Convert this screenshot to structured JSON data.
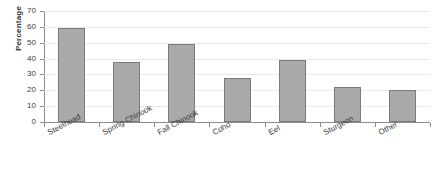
{
  "chart_data": {
    "type": "bar",
    "title": "",
    "xlabel": "",
    "ylabel": "Percentage",
    "ylim": [
      0,
      70
    ],
    "yticks": [
      0,
      10,
      20,
      30,
      40,
      50,
      60,
      70
    ],
    "ytick_labels": [
      "0",
      "10",
      "20",
      "30",
      "40",
      "50",
      "60",
      "70"
    ],
    "grid": true,
    "legend": "none",
    "categories": [
      "Steelhead",
      "Spring Chinook",
      "Fall Chinook",
      "Coho",
      "Eel",
      "Sturgeon",
      "Other"
    ],
    "values": [
      59,
      38,
      49,
      28,
      39,
      22,
      20
    ],
    "series": [
      {
        "name": "Percentage",
        "values": [
          59,
          38,
          49,
          28,
          39,
          22,
          20
        ]
      }
    ],
    "bar_fill_color": "#a9a9a9",
    "bar_border_color": "#7b7b7b",
    "gridline_color": "#e9e9e9",
    "axis_color": "#8c8c8c",
    "text_color": "#3a3a3a"
  }
}
